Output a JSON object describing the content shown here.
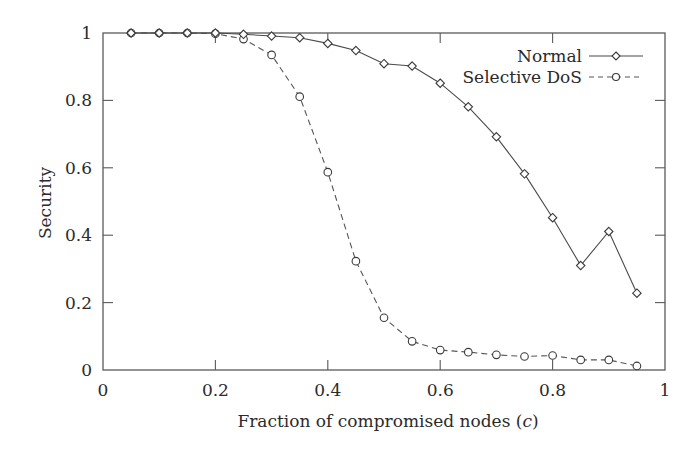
{
  "chart_data": {
    "type": "line",
    "title": "",
    "xlabel": "Fraction of compromised nodes",
    "xlabel_var": "c",
    "ylabel": "Security",
    "xlim": [
      0,
      1
    ],
    "ylim": [
      0,
      1
    ],
    "xticks": [
      0,
      0.2,
      0.4,
      0.6,
      0.8,
      1
    ],
    "xtick_labels": [
      "0",
      "0.2",
      "0.4",
      "0.6",
      "0.8",
      "1"
    ],
    "yticks": [
      0,
      0.2,
      0.4,
      0.6,
      0.8,
      1
    ],
    "ytick_labels": [
      "0",
      "0.2",
      "0.4",
      "0.6",
      "0.8",
      "1"
    ],
    "grid": false,
    "legend_position": "upper right",
    "x": [
      0.05,
      0.1,
      0.15,
      0.2,
      0.25,
      0.3,
      0.35,
      0.4,
      0.45,
      0.5,
      0.55,
      0.6,
      0.65,
      0.7,
      0.75,
      0.8,
      0.85,
      0.9,
      0.95
    ],
    "series": [
      {
        "name": "Normal",
        "line_style": "solid",
        "marker": "diamond",
        "values": [
          1.0,
          1.0,
          1.0,
          1.0,
          0.996,
          0.991,
          0.986,
          0.969,
          0.948,
          0.909,
          0.902,
          0.851,
          0.781,
          0.692,
          0.582,
          0.452,
          0.31,
          0.411,
          0.228
        ]
      },
      {
        "name": "Selective DoS",
        "line_style": "dashed",
        "marker": "circle",
        "values": [
          1.0,
          1.0,
          1.0,
          0.998,
          0.982,
          0.935,
          0.811,
          0.587,
          0.323,
          0.155,
          0.085,
          0.059,
          0.053,
          0.045,
          0.04,
          0.043,
          0.03,
          0.03,
          0.012
        ]
      }
    ]
  },
  "labels": {
    "xlabel_main": "Fraction of compromised nodes (",
    "xlabel_var": "c",
    "xlabel_close": ")",
    "ylabel": "Security",
    "legend_normal": "Normal",
    "legend_dos": "Selective DoS"
  }
}
